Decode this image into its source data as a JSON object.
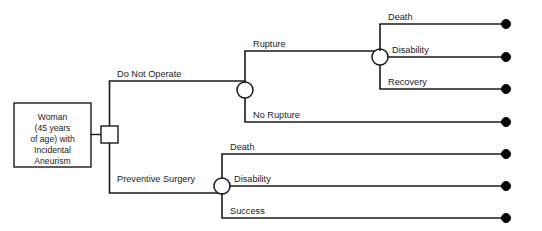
{
  "diagram": {
    "type": "decision-tree",
    "colors": {
      "line": "#1a1a1a",
      "node_fill": "#ffffff",
      "terminal": "#000000",
      "background": "#ffffff"
    },
    "root": {
      "shape": "rectangle",
      "lines": [
        "Woman",
        "(45 years",
        "of age) with",
        "Incidental",
        "Aneurism"
      ]
    },
    "decision_node": {
      "shape": "square",
      "name": "root-decision"
    },
    "branches": [
      {
        "label": "Do Not Operate",
        "node": "chance",
        "children": [
          {
            "label": "Rupture",
            "node": "chance",
            "children": [
              {
                "label": "Death",
                "node": "terminal"
              },
              {
                "label": "Disability",
                "node": "terminal"
              },
              {
                "label": "Recovery",
                "node": "terminal"
              }
            ]
          },
          {
            "label": "No Rupture",
            "node": "terminal",
            "children": []
          }
        ]
      },
      {
        "label": "Preventive Surgery",
        "node": "chance",
        "children": [
          {
            "label": "Death",
            "node": "terminal"
          },
          {
            "label": "Disability",
            "node": "terminal"
          },
          {
            "label": "Success",
            "node": "terminal"
          }
        ]
      }
    ],
    "labels": {
      "do_not_operate": "Do Not Operate",
      "preventive_surgery": "Preventive Surgery",
      "rupture": "Rupture",
      "no_rupture": "No Rupture",
      "rupture_death": "Death",
      "rupture_disability": "Disability",
      "rupture_recovery": "Recovery",
      "surgery_death": "Death",
      "surgery_disability": "Disability",
      "surgery_success": "Success"
    }
  }
}
